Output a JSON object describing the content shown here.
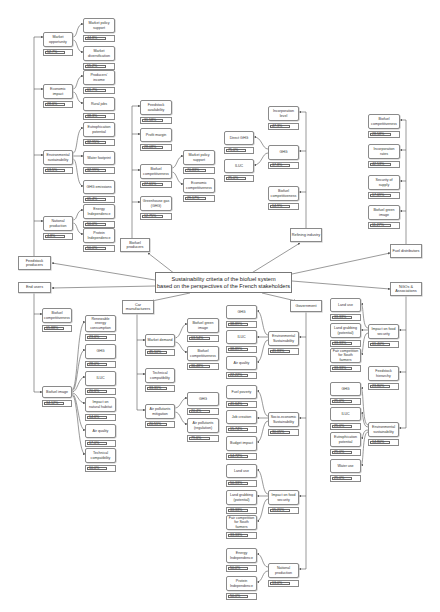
{
  "center": {
    "line1": "Sustainability criteria of the biofuel system",
    "line2": "based on the perspectives of the French stakeholders"
  },
  "colors": {
    "stroke": "#555555",
    "box_border": "#8a8a8a",
    "background": "#ffffff"
  },
  "stakeholders": [
    {
      "id": "feedstock",
      "label": "Feedstock producers",
      "x": 18,
      "y": 256,
      "w": 33,
      "h": 14
    },
    {
      "id": "endusers",
      "label": "End users",
      "x": 18,
      "y": 282,
      "w": 33,
      "h": 11
    },
    {
      "id": "biofuelprod",
      "label": "Biofuel producers",
      "x": 120,
      "y": 238,
      "w": 30,
      "h": 14
    },
    {
      "id": "refining",
      "label": "Refining industry",
      "x": 290,
      "y": 228,
      "w": 32,
      "h": 14
    },
    {
      "id": "fueldist",
      "label": "Fuel distributors",
      "x": 390,
      "y": 244,
      "w": 32,
      "h": 14
    },
    {
      "id": "carmanu",
      "label": "Car manufacturers",
      "x": 122,
      "y": 300,
      "w": 32,
      "h": 14
    },
    {
      "id": "government",
      "label": "Government",
      "x": 290,
      "y": 300,
      "w": 32,
      "h": 12
    },
    {
      "id": "ngos",
      "label": "NGOs & Associations",
      "x": 390,
      "y": 282,
      "w": 32,
      "h": 14
    }
  ],
  "nodes": [
    {
      "id": "mkt_opp",
      "label": "Market opportunity",
      "value": "52.7%",
      "x": 43,
      "y": 32,
      "w": 30,
      "h": 15
    },
    {
      "id": "mkt_pol",
      "label": "Market policy support",
      "value": "44.8%",
      "x": 83,
      "y": 18,
      "w": 32,
      "h": 15
    },
    {
      "id": "mkt_div",
      "label": "Market diversification",
      "value": "55.2%",
      "x": 83,
      "y": 46,
      "w": 32,
      "h": 15
    },
    {
      "id": "econ",
      "label": "Economic impact",
      "value": "28.6%",
      "x": 43,
      "y": 84,
      "w": 30,
      "h": 15
    },
    {
      "id": "prod_inc",
      "label": "Producers' income",
      "value": "61.7%",
      "x": 83,
      "y": 70,
      "w": 32,
      "h": 15
    },
    {
      "id": "rural",
      "label": "Rural jobs",
      "value": "38.3%",
      "x": 83,
      "y": 97,
      "w": 32,
      "h": 14
    },
    {
      "id": "env_sus",
      "label": "Environmental sustainability",
      "value": "13.5%",
      "x": 43,
      "y": 150,
      "w": 30,
      "h": 15
    },
    {
      "id": "eutro",
      "label": "Eutrophication potential",
      "value": "32.95%",
      "x": 83,
      "y": 122,
      "w": 32,
      "h": 15
    },
    {
      "id": "water",
      "label": "Water footprint",
      "value": "32.99%",
      "x": 83,
      "y": 151,
      "w": 32,
      "h": 14
    },
    {
      "id": "ghg_em",
      "label": "GHG emissions",
      "value": "65.4%",
      "x": 83,
      "y": 180,
      "w": 32,
      "h": 14
    },
    {
      "id": "nat_prod",
      "label": "National production",
      "value": "4.8%",
      "x": 43,
      "y": 216,
      "w": 30,
      "h": 15
    },
    {
      "id": "energy_ind",
      "label": "Energy Independence",
      "value": "50.0%",
      "x": 83,
      "y": 204,
      "w": 32,
      "h": 15
    },
    {
      "id": "protein_ind",
      "label": "Protein Independence",
      "value": "50.0%",
      "x": 83,
      "y": 228,
      "w": 32,
      "h": 15
    },
    {
      "id": "feed_avail",
      "label": "Feedstock availability",
      "value": "31.58%",
      "x": 140,
      "y": 100,
      "w": 32,
      "h": 15
    },
    {
      "id": "profit",
      "label": "Profit margin",
      "value": "28.08%",
      "x": 140,
      "y": 128,
      "w": 32,
      "h": 14
    },
    {
      "id": "bf_comp",
      "label": "Biofuel competitiveness",
      "value": "27.61%",
      "x": 140,
      "y": 164,
      "w": 32,
      "h": 15
    },
    {
      "id": "mkt_pol2",
      "label": "Market policy support",
      "value": "70.83%",
      "x": 183,
      "y": 150,
      "w": 32,
      "h": 15
    },
    {
      "id": "econ_comp",
      "label": "Economic competitiveness",
      "value": "29.17%",
      "x": 183,
      "y": 178,
      "w": 32,
      "h": 15
    },
    {
      "id": "ghg_gas",
      "label": "Greenhouse gas (GHG)",
      "value": "12.75%",
      "x": 140,
      "y": 196,
      "w": 32,
      "h": 15
    },
    {
      "id": "incorp_level",
      "label": "Incorporation level",
      "value": "47.3%",
      "x": 268,
      "y": 106,
      "w": 31,
      "h": 15
    },
    {
      "id": "ghg_ref",
      "label": "GHG",
      "value": "37.8%",
      "x": 268,
      "y": 145,
      "w": 31,
      "h": 15
    },
    {
      "id": "direct_ghg",
      "label": "Direct GHG",
      "value": "75.0%",
      "x": 224,
      "y": 131,
      "w": 30,
      "h": 14
    },
    {
      "id": "iluc_ref",
      "label": "ILUC",
      "value": "25.0%",
      "x": 224,
      "y": 159,
      "w": 30,
      "h": 14
    },
    {
      "id": "bf_comp_ref",
      "label": "Biofuel competitiveness",
      "value": "14.9%",
      "x": 268,
      "y": 186,
      "w": 31,
      "h": 15
    },
    {
      "id": "bf_comp_fd",
      "label": "Biofuel competitiveness",
      "value": "28.58%",
      "x": 368,
      "y": 114,
      "w": 32,
      "h": 15
    },
    {
      "id": "incorp_rate",
      "label": "Incorporation rates",
      "value": "42.53%",
      "x": 368,
      "y": 144,
      "w": 32,
      "h": 15
    },
    {
      "id": "security",
      "label": "Security of supply",
      "value": "17.69%",
      "x": 368,
      "y": 175,
      "w": 32,
      "h": 15
    },
    {
      "id": "green_fd",
      "label": "Biofuel green image",
      "value": "11.27%",
      "x": 368,
      "y": 205,
      "w": 32,
      "h": 15
    },
    {
      "id": "bf_comp_eu",
      "label": "Biofuel competitiveness",
      "value": "65.88%",
      "x": 42,
      "y": 308,
      "w": 30,
      "h": 15
    },
    {
      "id": "bf_image",
      "label": "Biofuel image",
      "value": "34.12%",
      "x": 42,
      "y": 386,
      "w": 30,
      "h": 12
    },
    {
      "id": "renew",
      "label": "Renewable energy consumption",
      "value": "23.6%",
      "x": 85,
      "y": 315,
      "w": 31,
      "h": 17
    },
    {
      "id": "ghg_eu",
      "label": "GHG",
      "value": "28.0%",
      "x": 85,
      "y": 344,
      "w": 31,
      "h": 15
    },
    {
      "id": "iluc_eu",
      "label": "ILUC",
      "value": "20.6%",
      "x": 85,
      "y": 371,
      "w": 31,
      "h": 15
    },
    {
      "id": "impact_hab",
      "label": "Impact on natural habitat",
      "value": "14.6%",
      "x": 85,
      "y": 397,
      "w": 31,
      "h": 15
    },
    {
      "id": "airq_eu",
      "label": "Air quality",
      "value": "17.0%",
      "x": 85,
      "y": 424,
      "w": 31,
      "h": 14
    },
    {
      "id": "tech_eu",
      "label": "Technical compatibility",
      "value": "10.0%",
      "x": 85,
      "y": 448,
      "w": 31,
      "h": 15
    },
    {
      "id": "mkt_demand",
      "label": "Market demand",
      "value": "45.10%",
      "x": 145,
      "y": 334,
      "w": 30,
      "h": 13
    },
    {
      "id": "bf_green_car",
      "label": "Biofuel green image",
      "value": "63.54%",
      "x": 187,
      "y": 318,
      "w": 32,
      "h": 15
    },
    {
      "id": "bf_comp_car",
      "label": "Biofuel competitiveness",
      "value": "36.48%",
      "x": 187,
      "y": 346,
      "w": 32,
      "h": 15
    },
    {
      "id": "tech_car",
      "label": "Technical compatibility",
      "value": "33.31%",
      "x": 145,
      "y": 368,
      "w": 30,
      "h": 15
    },
    {
      "id": "air_poll",
      "label": "Air pollutants mitigation",
      "value": "20.51%",
      "x": 145,
      "y": 404,
      "w": 30,
      "h": 15
    },
    {
      "id": "ghg_car",
      "label": "GHG",
      "value": "20.4%",
      "x": 187,
      "y": 392,
      "w": 32,
      "h": 14
    },
    {
      "id": "air_poll_reg",
      "label": "Air pollutants (regulation)",
      "value": "79.6%",
      "x": 187,
      "y": 418,
      "w": 32,
      "h": 15
    },
    {
      "id": "ghg_gov",
      "label": "GHG",
      "value": "38.89%",
      "x": 226,
      "y": 305,
      "w": 31,
      "h": 14
    },
    {
      "id": "iluc_gov",
      "label": "ILUC",
      "value": "38.89%",
      "x": 226,
      "y": 330,
      "w": 31,
      "h": 14
    },
    {
      "id": "env_gov",
      "label": "Environmental Sustainability",
      "value": "41.83%",
      "x": 268,
      "y": 331,
      "w": 31,
      "h": 15
    },
    {
      "id": "airq_gov",
      "label": "Air quality",
      "value": "22.22%",
      "x": 226,
      "y": 356,
      "w": 31,
      "h": 14
    },
    {
      "id": "fuel_pov",
      "label": "Fuel poverty",
      "value": "41.64%",
      "x": 226,
      "y": 385,
      "w": 31,
      "h": 14
    },
    {
      "id": "socio",
      "label": "Socio-economic Sustainability",
      "value": "30.05%",
      "x": 268,
      "y": 412,
      "w": 31,
      "h": 15
    },
    {
      "id": "job",
      "label": "Job creation",
      "value": "15.74%",
      "x": 226,
      "y": 410,
      "w": 31,
      "h": 14
    },
    {
      "id": "budget",
      "label": "Budget impact",
      "value": "14.72%",
      "x": 226,
      "y": 436,
      "w": 31,
      "h": 15
    },
    {
      "id": "land_gov",
      "label": "Land use",
      "value": "50.33%",
      "x": 226,
      "y": 464,
      "w": 31,
      "h": 14
    },
    {
      "id": "food_gov",
      "label": "Impact on food security",
      "value": "15.21%",
      "x": 268,
      "y": 490,
      "w": 31,
      "h": 15
    },
    {
      "id": "grab_gov",
      "label": "Land grabbing (potential)",
      "value": "33.33%",
      "x": 226,
      "y": 490,
      "w": 31,
      "h": 15
    },
    {
      "id": "fair_gov",
      "label": "Fair competition for South farmers",
      "value": "33.33%",
      "x": 226,
      "y": 515,
      "w": 31,
      "h": 15
    },
    {
      "id": "nat_gov",
      "label": "National production",
      "value": "13.0%",
      "x": 268,
      "y": 563,
      "w": 31,
      "h": 15
    },
    {
      "id": "energy_gov",
      "label": "Energy Independence",
      "value": "50.0%",
      "x": 226,
      "y": 548,
      "w": 31,
      "h": 15
    },
    {
      "id": "protein_gov",
      "label": "Protein Independence",
      "value": "50.0%",
      "x": 226,
      "y": 576,
      "w": 31,
      "h": 15
    },
    {
      "id": "land_ngo",
      "label": "Land use",
      "value": "33.33%",
      "x": 330,
      "y": 298,
      "w": 31,
      "h": 14
    },
    {
      "id": "grab_ngo",
      "label": "Land grabbing (potential)",
      "value": "33.33%",
      "x": 330,
      "y": 323,
      "w": 31,
      "h": 15
    },
    {
      "id": "food_ngo",
      "label": "Impact on food security",
      "value": "61.40%",
      "x": 368,
      "y": 324,
      "w": 31,
      "h": 15
    },
    {
      "id": "fair_ngo",
      "label": "Fair competition for South farmers",
      "value": "33.33%",
      "x": 330,
      "y": 348,
      "w": 31,
      "h": 15
    },
    {
      "id": "feed_hier",
      "label": "Feedstock hierarchy",
      "value": "23.80%",
      "x": 368,
      "y": 366,
      "w": 31,
      "h": 15
    },
    {
      "id": "ghg_ngo",
      "label": "GHG",
      "value": "25.0%",
      "x": 330,
      "y": 382,
      "w": 31,
      "h": 14
    },
    {
      "id": "iluc_ngo",
      "label": "ILUC",
      "value": "25.0%",
      "x": 330,
      "y": 407,
      "w": 31,
      "h": 14
    },
    {
      "id": "env_ngo",
      "label": "Environmental sustainability",
      "value": "14.80%",
      "x": 368,
      "y": 422,
      "w": 31,
      "h": 15
    },
    {
      "id": "eutro_ngo",
      "label": "Eutrophication potential",
      "value": "25.0%",
      "x": 330,
      "y": 432,
      "w": 31,
      "h": 15
    },
    {
      "id": "water_ngo",
      "label": "Water use",
      "value": "25.0%",
      "x": 330,
      "y": 459,
      "w": 31,
      "h": 14
    }
  ]
}
